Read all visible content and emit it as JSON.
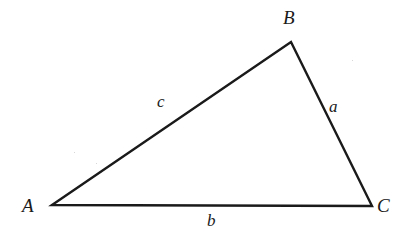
{
  "figure": {
    "type": "labeled-triangle",
    "background_color": "#ffffff",
    "stroke_color": "#1a1a1a",
    "stroke_width": 2,
    "clipped_header_text": "· · · · · ·",
    "vertices": [
      {
        "name": "A",
        "label": "A",
        "x": 52,
        "y": 205
      },
      {
        "name": "B",
        "label": "B",
        "x": 291,
        "y": 42
      },
      {
        "name": "C",
        "label": "C",
        "x": 372,
        "y": 206
      }
    ],
    "sides": [
      {
        "name": "a",
        "label": "a",
        "between": "B-C",
        "label_x": 335,
        "label_y": 108
      },
      {
        "name": "b",
        "label": "b",
        "between": "A-C",
        "label_x": 213,
        "label_y": 222
      },
      {
        "name": "c",
        "label": "c",
        "between": "A-B",
        "label_x": 163,
        "label_y": 103
      }
    ]
  }
}
